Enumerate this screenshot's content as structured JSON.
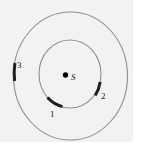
{
  "figure": {
    "type": "orbital-diagram",
    "background_color": "#f2f2f1",
    "page_color": "#ffffff",
    "orbit_stroke_color": "#8c8c8c",
    "segment_color": "#201f1f",
    "label_color": "#1a1a1a",
    "center": {
      "label": "S",
      "dot_color": "#000000",
      "cx": 65,
      "cy": 75,
      "r": 2.6
    },
    "orbits": [
      {
        "name": "inner-orbit",
        "cx": 70,
        "cy": 74,
        "rx": 31,
        "ry": 34,
        "stroke_width": 1
      },
      {
        "name": "outer-orbit",
        "cx": 70,
        "cy": 76,
        "rx": 57,
        "ry": 64,
        "stroke_width": 1
      }
    ],
    "segments": [
      {
        "label": "1",
        "orbit": "inner-orbit",
        "start_angle_deg": 108,
        "end_angle_deg": 128,
        "stroke_width": 3
      },
      {
        "label": "2",
        "orbit": "inner-orbit",
        "start_angle_deg": 10,
        "end_angle_deg": 40,
        "stroke_width": 3
      },
      {
        "label": "3",
        "orbit": "outer-orbit",
        "start_angle_deg": 192,
        "end_angle_deg": 212,
        "stroke_width": 3
      }
    ],
    "labels": [
      {
        "name": "segment-1-label",
        "text": "1"
      },
      {
        "name": "segment-2-label",
        "text": "2"
      },
      {
        "name": "segment-3-label",
        "text": "3"
      },
      {
        "name": "center-label",
        "text": "S"
      }
    ]
  }
}
